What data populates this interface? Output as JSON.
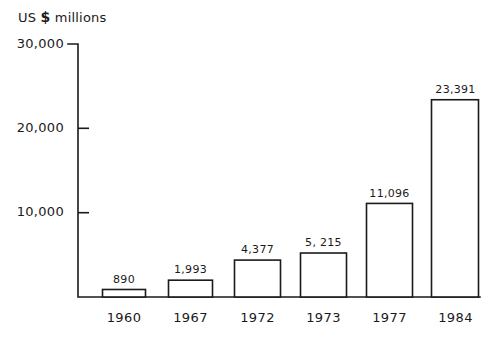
{
  "chart_data": {
    "type": "bar",
    "title": "US $ millions",
    "title_prefix": "US",
    "title_currency": "$",
    "title_suffix": "millions",
    "xlabel": "",
    "ylabel": "US $ millions",
    "categories": [
      "1960",
      "1967",
      "1972",
      "1973",
      "1977",
      "1984"
    ],
    "values": [
      890,
      1993,
      4377,
      5215,
      11096,
      23391
    ],
    "value_labels": [
      "890",
      "1,993",
      "4,377",
      "5, 215",
      "11,096",
      "23,391"
    ],
    "ylim": [
      0,
      30000
    ],
    "yticks": [
      30000,
      20000,
      10000
    ],
    "ytick_labels": [
      "30,000",
      "20,000",
      "10,000"
    ],
    "grid": false,
    "legend": null,
    "bar_fill": "#ffffff",
    "bar_stroke": "#1a1a1a",
    "axis_color": "#1a1a1a",
    "background": "#ffffff"
  }
}
